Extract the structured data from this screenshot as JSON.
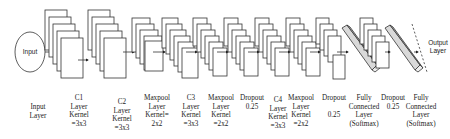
{
  "diagram": {
    "type": "cnn-architecture",
    "input_node": "Input",
    "output_node": [
      "Output",
      "Layer"
    ],
    "colors": {
      "stroke": "#333333",
      "fill": "#ffffff",
      "dense_fill": "#d9d9d9",
      "text": "#222222"
    }
  },
  "labels": [
    {
      "id": "input",
      "lines": [
        "Input",
        "Layer"
      ],
      "x": 38,
      "y": 103
    },
    {
      "id": "c1",
      "lines": [
        "C1",
        "Layer",
        "Kernel",
        "=3x3"
      ],
      "x": 79,
      "y": 94
    },
    {
      "id": "c2",
      "lines": [
        "C2",
        "Layer",
        "Kernel",
        "=3x3"
      ],
      "x": 122,
      "y": 98
    },
    {
      "id": "maxpool1",
      "lines": [
        "Maxpool",
        "Layer",
        "Kernel=",
        "2x2"
      ],
      "x": 157,
      "y": 94
    },
    {
      "id": "c3",
      "lines": [
        "C3",
        "Layer",
        "Kernel",
        "=3x3"
      ],
      "x": 191,
      "y": 94
    },
    {
      "id": "maxpool2",
      "lines": [
        "Maxpool",
        "Layer",
        "Kernel",
        "=2x2"
      ],
      "x": 221,
      "y": 94
    },
    {
      "id": "dropout1",
      "lines": [
        "Dropout",
        "0.25"
      ],
      "x": 252,
      "y": 94
    },
    {
      "id": "c4",
      "lines": [
        "C4",
        "Layer",
        "Kernel",
        "=3x3"
      ],
      "x": 278,
      "y": 96
    },
    {
      "id": "maxpool3",
      "lines": [
        "Maxpool",
        "Layer",
        "Kernel",
        "=2x2"
      ],
      "x": 301,
      "y": 94
    },
    {
      "id": "dropout2",
      "lines": [
        "Dropout",
        "",
        "0.25"
      ],
      "x": 334,
      "y": 94
    },
    {
      "id": "fc1",
      "lines": [
        "Fully",
        "Connected",
        "Layer",
        "(Softmax)"
      ],
      "x": 364,
      "y": 94
    },
    {
      "id": "dropout3",
      "lines": [
        "Dropout",
        "0.25"
      ],
      "x": 393,
      "y": 94
    },
    {
      "id": "fc2",
      "lines": [
        "Fully",
        "Connected",
        "Layer",
        "(Softmax)"
      ],
      "x": 421,
      "y": 94
    }
  ]
}
